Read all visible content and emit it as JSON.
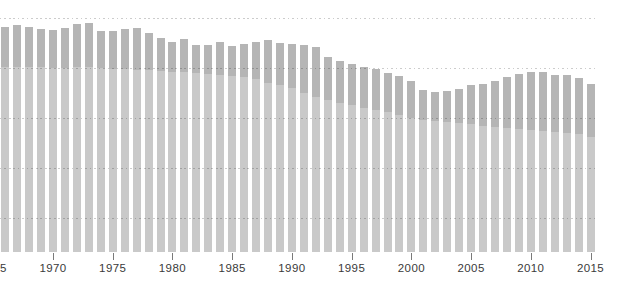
{
  "chart_data": {
    "type": "bar",
    "title": "",
    "xlabel": "",
    "ylabel": "",
    "legend": "none",
    "grid": "5 horizontal dotted gridlines, evenly spaced; no visible y-axis tick labels; no baseline axis line",
    "value_note": "values are bar heights as percent of plot height where the top gridline = 100 and the bar baseline = 0 (chart has no visible y-axis labels)",
    "x_years": [
      1966,
      1967,
      1968,
      1969,
      1970,
      1971,
      1972,
      1973,
      1974,
      1975,
      1976,
      1977,
      1978,
      1979,
      1980,
      1981,
      1982,
      1983,
      1984,
      1985,
      1986,
      1987,
      1988,
      1989,
      1990,
      1991,
      1992,
      1993,
      1994,
      1995,
      1996,
      1997,
      1998,
      1999,
      2000,
      2001,
      2002,
      2003,
      2004,
      2005,
      2006,
      2007,
      2008,
      2009,
      2010,
      2011,
      2012,
      2013,
      2014,
      2015
    ],
    "series": [
      {
        "name": "back-darker-series",
        "role": "back",
        "color": "#b5b5b5",
        "values_pct": [
          96.2,
          97.0,
          96.2,
          95.3,
          94.9,
          95.7,
          97.4,
          97.9,
          94.4,
          94.4,
          95.3,
          95.7,
          93.6,
          91.5,
          89.7,
          91.0,
          88.5,
          88.5,
          89.7,
          88.0,
          88.9,
          89.7,
          90.6,
          89.3,
          88.9,
          88.5,
          87.6,
          83.3,
          81.6,
          80.3,
          79.1,
          78.2,
          76.5,
          75.2,
          73.1,
          69.2,
          68.4,
          68.8,
          69.7,
          71.4,
          71.8,
          73.1,
          74.8,
          76.1,
          76.9,
          76.9,
          75.6,
          75.6,
          74.4,
          71.8
        ]
      },
      {
        "name": "front-lighter-series",
        "role": "front",
        "color": "#c9c9c9",
        "values_pct": [
          79.1,
          79.1,
          79.1,
          79.1,
          78.6,
          78.6,
          79.1,
          79.1,
          78.6,
          78.2,
          78.2,
          77.8,
          77.8,
          77.4,
          76.9,
          76.9,
          76.5,
          76.1,
          75.6,
          75.2,
          74.8,
          73.9,
          72.2,
          71.4,
          70.1,
          67.9,
          66.2,
          65.0,
          63.7,
          62.8,
          61.5,
          60.7,
          59.8,
          58.5,
          57.3,
          56.4,
          56.0,
          55.6,
          55.1,
          54.7,
          53.8,
          53.4,
          53.0,
          52.6,
          52.1,
          51.7,
          51.3,
          50.9,
          50.4,
          49.1
        ]
      }
    ],
    "xtick_labels": [
      "1965",
      "1970",
      "1975",
      "1980",
      "1985",
      "1990",
      "1995",
      "2000",
      "2005",
      "2010",
      "2015"
    ],
    "xtick_note": "1965 label is clipped at the left edge of the image; only the tail of its last digit is visible"
  },
  "colors": {
    "background": "#ffffff",
    "bar_back": "#b5b5b5",
    "bar_front": "#c9c9c9",
    "gridline_dots": "#d0d0d0",
    "tick_mark": "#7a7a7a",
    "tick_label_text": "#3a3a3a"
  }
}
